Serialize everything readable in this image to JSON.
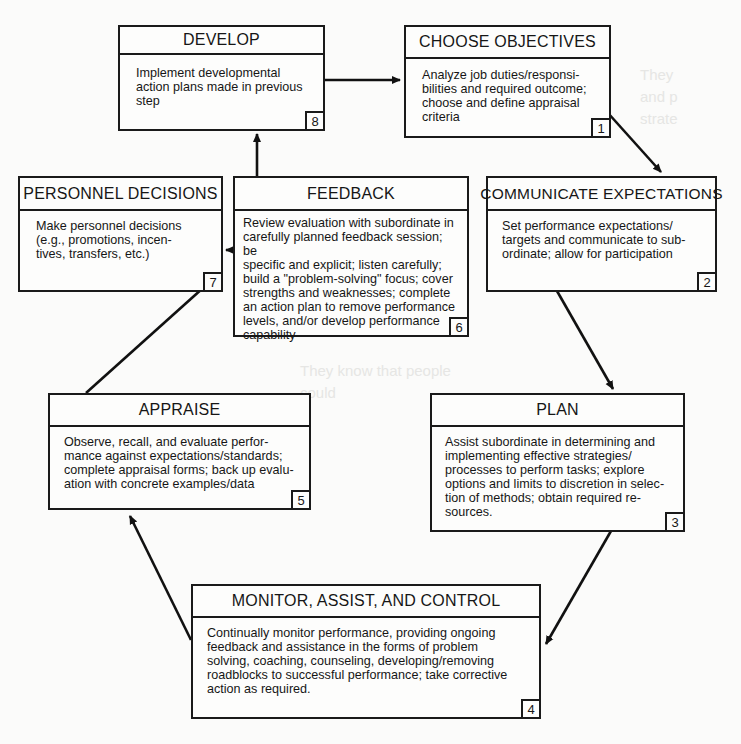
{
  "diagram": {
    "type": "performance-management-cycle",
    "steps": [
      {
        "number": "1",
        "title": "CHOOSE OBJECTIVES",
        "lines": [
          "Analyze job duties/responsi-",
          "bilities and required outcome;",
          "choose and define appraisal",
          "criteria"
        ]
      },
      {
        "number": "2",
        "title": "COMMUNICATE EXPECTATIONS",
        "lines": [
          "Set performance expectations/",
          "targets and communicate to sub-",
          "ordinate; allow for participation"
        ]
      },
      {
        "number": "3",
        "title": "PLAN",
        "lines": [
          "Assist subordinate in determining and",
          "implementing effective strategies/",
          "processes to perform tasks; explore",
          "options and limits to discretion in selec-",
          "tion of methods; obtain required re-",
          "sources."
        ]
      },
      {
        "number": "4",
        "title": "MONITOR, ASSIST, AND CONTROL",
        "lines": [
          "Continually monitor performance, providing ongoing",
          "feedback and assistance in the forms of problem",
          "solving, coaching, counseling, developing/removing",
          "roadblocks to successful performance; take corrective",
          "action as required."
        ]
      },
      {
        "number": "5",
        "title": "APPRAISE",
        "lines": [
          "Observe, recall, and evaluate perfor-",
          "mance against expectations/standards;",
          "complete appraisal forms; back up evalu-",
          "ation with concrete examples/data"
        ]
      },
      {
        "number": "6",
        "title": "FEEDBACK",
        "lines": [
          "Review evaluation with subordinate in",
          "carefully planned feedback session; be",
          "specific and explicit; listen carefully;",
          "build a \"problem-solving\" focus; cover",
          "strengths and weaknesses; complete",
          "an action plan to remove performance",
          "levels, and/or develop performance",
          "capability"
        ]
      },
      {
        "number": "7",
        "title": "PERSONNEL DECISIONS",
        "lines": [
          "Make personnel decisions",
          "(e.g., promotions, incen-",
          "tives, transfers, etc.)"
        ]
      },
      {
        "number": "8",
        "title": "DEVELOP",
        "lines": [
          "Implement developmental",
          "action plans made in previous",
          "step"
        ]
      }
    ],
    "flows": [
      {
        "from": "8",
        "to": "1"
      },
      {
        "from": "1",
        "to": "2"
      },
      {
        "from": "2",
        "to": "3"
      },
      {
        "from": "3",
        "to": "4"
      },
      {
        "from": "4",
        "to": "5"
      },
      {
        "from": "5",
        "to": "6"
      },
      {
        "from": "6",
        "to": "7"
      },
      {
        "from": "6",
        "to": "8"
      }
    ]
  }
}
